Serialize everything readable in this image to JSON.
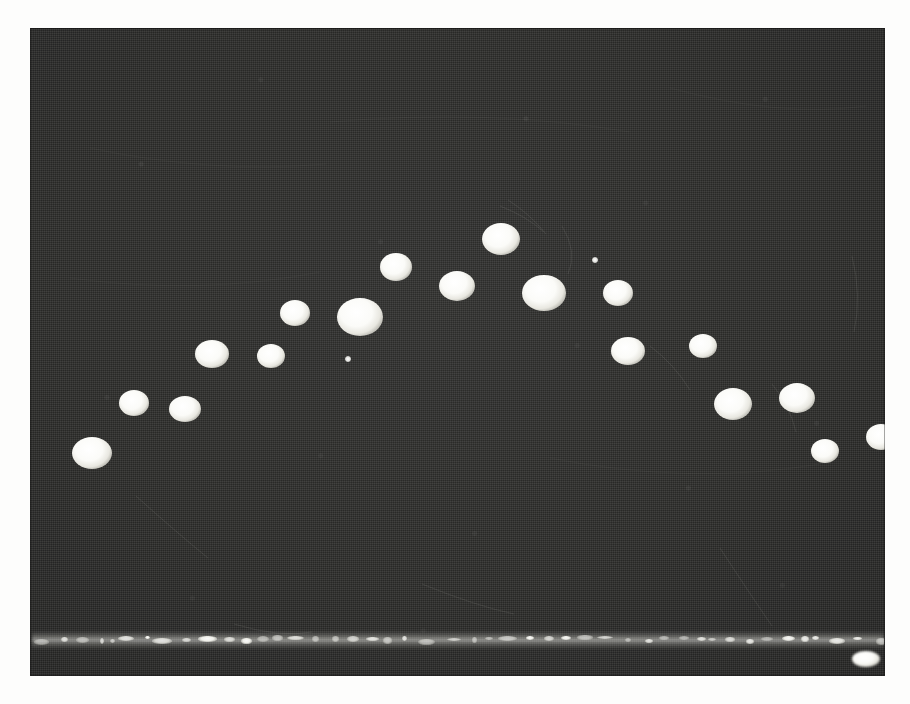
{
  "figure": {
    "kind": "photographic-plate",
    "caption": "",
    "background_color": "#2b2b2b",
    "spot_color": "#ffffff",
    "paper_color": "#fdfdfc",
    "plate": {
      "x": 30,
      "y": 28,
      "width": 855,
      "height": 648
    }
  },
  "chart_data": {
    "type": "scatter",
    "title": "",
    "subtitle": "",
    "xlabel": "",
    "ylabel": "",
    "xlim": [
      0,
      855
    ],
    "ylim": [
      0,
      648
    ],
    "grid": false,
    "legend": null,
    "point_count": 22,
    "points": [
      {
        "id": 1,
        "x": 62,
        "y": 425,
        "rx": 20,
        "ry": 16,
        "soft": false
      },
      {
        "id": 2,
        "x": 104,
        "y": 375,
        "rx": 15,
        "ry": 13,
        "soft": false
      },
      {
        "id": 3,
        "x": 155,
        "y": 381,
        "rx": 16,
        "ry": 13,
        "soft": false
      },
      {
        "id": 4,
        "x": 182,
        "y": 326,
        "rx": 17,
        "ry": 14,
        "soft": false
      },
      {
        "id": 5,
        "x": 241,
        "y": 328,
        "rx": 14,
        "ry": 12,
        "soft": false
      },
      {
        "id": 6,
        "x": 265,
        "y": 285,
        "rx": 15,
        "ry": 13,
        "soft": false
      },
      {
        "id": 7,
        "x": 330,
        "y": 289,
        "rx": 23,
        "ry": 19,
        "soft": false
      },
      {
        "id": 8,
        "x": 366,
        "y": 239,
        "rx": 16,
        "ry": 14,
        "soft": false
      },
      {
        "id": 9,
        "x": 427,
        "y": 258,
        "rx": 18,
        "ry": 15,
        "soft": false
      },
      {
        "id": 10,
        "x": 471,
        "y": 211,
        "rx": 19,
        "ry": 16,
        "soft": false
      },
      {
        "id": 11,
        "x": 514,
        "y": 265,
        "rx": 22,
        "ry": 18,
        "soft": false
      },
      {
        "id": 12,
        "x": 588,
        "y": 265,
        "rx": 15,
        "ry": 13,
        "soft": false
      },
      {
        "id": 13,
        "x": 598,
        "y": 323,
        "rx": 17,
        "ry": 14,
        "soft": false
      },
      {
        "id": 14,
        "x": 673,
        "y": 318,
        "rx": 14,
        "ry": 12,
        "soft": false
      },
      {
        "id": 15,
        "x": 703,
        "y": 376,
        "rx": 19,
        "ry": 16,
        "soft": false
      },
      {
        "id": 16,
        "x": 767,
        "y": 370,
        "rx": 18,
        "ry": 15,
        "soft": false
      },
      {
        "id": 17,
        "x": 795,
        "y": 423,
        "rx": 14,
        "ry": 12,
        "soft": false
      },
      {
        "id": 18,
        "x": 851,
        "y": 409,
        "rx": 15,
        "ry": 13,
        "soft": false
      },
      {
        "id": 19,
        "x": 836,
        "y": 631,
        "rx": 14,
        "ry": 8,
        "soft": true
      },
      {
        "id": 20,
        "x": 318,
        "y": 331,
        "rx": 3,
        "ry": 3,
        "soft": true
      },
      {
        "id": 21,
        "x": 294,
        "y": 658,
        "rx": 4,
        "ry": 4,
        "soft": true
      },
      {
        "id": 22,
        "x": 565,
        "y": 232,
        "rx": 3,
        "ry": 3,
        "soft": true
      }
    ],
    "baseline": {
      "label": "baseline-trace",
      "y": 640,
      "x_start": 32,
      "x_end": 884,
      "style": "dashed-speckled",
      "color": "#f5f5ef"
    }
  }
}
